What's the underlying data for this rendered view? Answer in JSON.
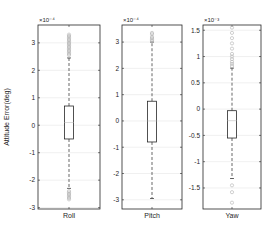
{
  "chart_data": {
    "type": "box",
    "ylabel": "Attitude Error(deg)",
    "grid": true,
    "panels": [
      {
        "category": "Roll",
        "exponent_label": "×10⁻⁴",
        "scale": 0.0001,
        "ylim": [
          -3.05,
          3.65
        ],
        "yticks": [
          -3,
          -2,
          -1,
          0,
          1,
          2,
          3
        ],
        "box": {
          "q1": -0.5,
          "median": 0.1,
          "q3": 0.7,
          "whisker_low": -2.3,
          "whisker_high": 2.45
        },
        "outliers": [
          2.55,
          2.6,
          2.65,
          2.7,
          2.75,
          2.8,
          2.85,
          2.9,
          2.95,
          3.0,
          3.05,
          3.1,
          3.15,
          3.2,
          3.25,
          3.3,
          -2.4,
          -2.45,
          -2.5,
          -2.55,
          -2.6,
          -2.65,
          -2.7
        ]
      },
      {
        "category": "Pitch",
        "exponent_label": "×10⁻⁴",
        "scale": 0.0001,
        "ylim": [
          -3.35,
          3.65
        ],
        "yticks": [
          -3,
          -2,
          -1,
          0,
          1,
          2,
          3
        ],
        "box": {
          "q1": -0.8,
          "median": 0.0,
          "q3": 0.75,
          "whisker_low": -2.95,
          "whisker_high": 3.0
        },
        "outliers": [
          3.05,
          3.1,
          3.15,
          3.2,
          3.3,
          3.35
        ]
      },
      {
        "category": "Yaw",
        "exponent_label": "×10⁻³",
        "scale": 0.001,
        "ylim": [
          -1.9,
          1.6
        ],
        "yticks": [
          -1.5,
          -1,
          -0.5,
          0,
          0.5,
          1,
          1.5
        ],
        "ytick_labels": [
          "-1.5",
          "-1",
          "-0.5",
          "0",
          "0.5",
          "1",
          "1.5"
        ],
        "box": {
          "q1": -0.55,
          "median": -0.22,
          "q3": -0.03,
          "whisker_low": -1.32,
          "whisker_high": 0.78
        },
        "outliers": [
          0.82,
          0.86,
          0.9,
          0.95,
          1.0,
          1.05,
          1.15,
          1.25,
          1.35,
          1.45,
          1.55,
          -1.45,
          -1.58,
          -1.78
        ]
      }
    ]
  },
  "colors": {
    "axis": "#262626",
    "grid": "#e6e6e6",
    "box": "#262626",
    "whisker": "#262626",
    "outlier": "#b0b0b0",
    "median": "#c8c8c8"
  },
  "layout": {
    "panels_px": [
      {
        "x0": 38,
        "x1": 100,
        "y0": 25,
        "y1": 209
      },
      {
        "x0": 122,
        "x1": 182,
        "y0": 25,
        "y1": 209
      },
      {
        "x0": 203,
        "x1": 261,
        "y0": 25,
        "y1": 209
      }
    ],
    "box_half_width": 4.5
  }
}
